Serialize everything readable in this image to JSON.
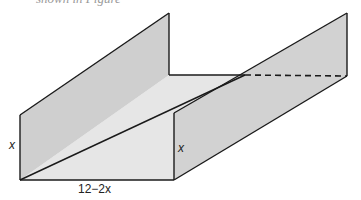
{
  "figure": {
    "caption_fragment": "shown in Figure",
    "labels": {
      "left_height": "x",
      "right_height": "x",
      "base_width": "12−2x"
    },
    "colors": {
      "wall_fill": "#cfcfcf",
      "floor_fill": "#e6e6e6",
      "edge": "#1a1a1a",
      "background": "#ffffff"
    }
  }
}
